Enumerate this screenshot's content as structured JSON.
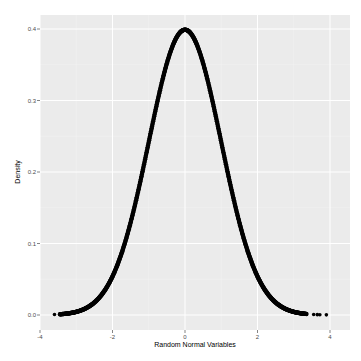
{
  "chart_data": {
    "type": "scatter",
    "title": "",
    "xlabel": "Random Normal Variables",
    "ylabel": "Density",
    "xlim": [
      -4.0,
      4.2
    ],
    "ylim": [
      -0.02,
      0.42
    ],
    "x_ticks": [
      -4,
      -2,
      0,
      2,
      4
    ],
    "x_tick_labels": [
      "-4",
      "-2",
      "0",
      "2",
      "4"
    ],
    "y_ticks": [
      0.0,
      0.1,
      0.2,
      0.3,
      0.4
    ],
    "y_tick_labels": [
      "0.0",
      "0.1",
      "0.2",
      "0.3",
      "0.4"
    ],
    "grid": true,
    "theme": "ggplot2 grey",
    "series": [
      {
        "name": "dnorm density",
        "description": "Standard normal density evaluated at random normal draws (dense points forming a bell curve)",
        "x_range": [
          -3.6,
          3.9
        ],
        "peak": {
          "x": 0,
          "y": 0.399
        },
        "sparse_tail_points_x": [
          -3.6,
          3.55,
          3.65,
          3.72,
          3.9
        ]
      }
    ],
    "colors": {
      "panel_background": "#ebebeb",
      "grid_major": "#ffffff",
      "grid_minor": "#f5f5f5",
      "points": "#000000"
    }
  }
}
